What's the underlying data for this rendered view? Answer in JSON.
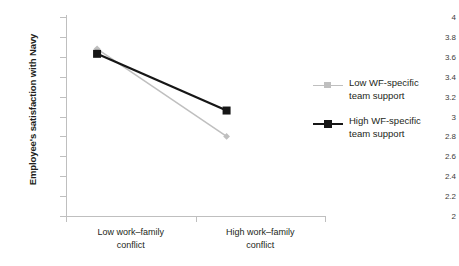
{
  "chart_data": {
    "type": "line",
    "title": "",
    "subtitle": "",
    "xlabel": "",
    "ylabel": "Employee's satisfaction with Navy",
    "categories": [
      "Low work–family conflict",
      "High work–family conflict"
    ],
    "ylim": [
      2,
      4
    ],
    "ytick_step": 0.2,
    "yticks": [
      "4",
      "3.8",
      "3.6",
      "3.4",
      "3.2",
      "3",
      "2.8",
      "2.6",
      "2.4",
      "2.2",
      "2"
    ],
    "ytick_values": [
      4,
      3.8,
      3.6,
      3.4,
      3.2,
      3,
      2.8,
      2.6,
      2.4,
      2.2,
      2
    ],
    "grid": false,
    "legend_position": "right",
    "series": [
      {
        "name": "Low WF-specific team support",
        "label_line1": "Low WF-specific",
        "label_line2": "team support",
        "values": [
          3.68,
          2.8
        ],
        "color": "#bfbfbf",
        "marker": "diamond"
      },
      {
        "name": "High WF-specific team support",
        "label_line1": "High WF-specific",
        "label_line2": "team support",
        "values": [
          3.63,
          3.06
        ],
        "color": "#161616",
        "marker": "square"
      }
    ]
  },
  "axis": {
    "y_title": "Employee's satisfaction with Navy",
    "x_categories": [
      {
        "line1": "Low work–family",
        "line2": "conflict"
      },
      {
        "line1": "High work–family",
        "line2": "conflict"
      }
    ]
  },
  "colors": {
    "axis": "#bfbfbf",
    "text": "#231f20",
    "series_low": "#bfbfbf",
    "series_high": "#161616",
    "background": "#ffffff"
  }
}
